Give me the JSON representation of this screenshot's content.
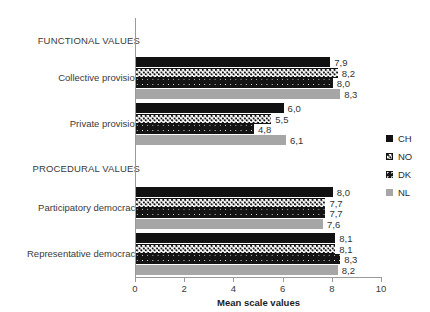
{
  "chart_data": {
    "type": "bar",
    "orientation": "horizontal",
    "title": "",
    "xlabel": "Mean scale values",
    "ylabel": "",
    "xlim": [
      0,
      10
    ],
    "xticks": [
      "0",
      "2",
      "4",
      "6",
      "8",
      "10"
    ],
    "grid": false,
    "legend_position": "right",
    "group_headers": [
      "FUNCTIONAL VALUES",
      "PROCEDURAL VALUES"
    ],
    "categories": [
      "Collective provision",
      "Private provision",
      "Participatory democracy",
      "Representative democracy"
    ],
    "series": [
      {
        "name": "CH",
        "pattern": "solid-black",
        "color": "#111111",
        "values": [
          7.9,
          6.0,
          8.0,
          8.1
        ],
        "labels": [
          "7,9",
          "6,0",
          "8,0",
          "8,1"
        ]
      },
      {
        "name": "NO",
        "pattern": "dotted-white",
        "color": "#ffffff",
        "values": [
          8.2,
          5.5,
          7.7,
          8.1
        ],
        "labels": [
          "8,2",
          "5,5",
          "7,7",
          "8,1"
        ]
      },
      {
        "name": "DK",
        "pattern": "dark-speckled",
        "color": "#141414",
        "values": [
          8.0,
          4.8,
          7.7,
          8.3
        ],
        "labels": [
          "8,0",
          "4,8",
          "7,7",
          "8,3"
        ]
      },
      {
        "name": "NL",
        "pattern": "solid-gray",
        "color": "#a6a6a6",
        "values": [
          8.3,
          6.1,
          7.6,
          8.2
        ],
        "labels": [
          "8,3",
          "6,1",
          "7,6",
          "8,2"
        ]
      }
    ]
  },
  "legend": {
    "items": [
      {
        "label": "CH"
      },
      {
        "label": "NO"
      },
      {
        "label": "DK"
      },
      {
        "label": "NL"
      }
    ]
  },
  "axis": {
    "x_title": "Mean scale values",
    "ticks": [
      "0",
      "2",
      "4",
      "6",
      "8",
      "10"
    ]
  },
  "labels": {
    "functional_header": "FUNCTIONAL VALUES",
    "procedural_header": "PROCEDURAL VALUES",
    "collective_provision": "Collective provision",
    "private_provision": "Private provision",
    "participatory_democracy": "Participatory democracy",
    "representative_democracy": "Representative democracy"
  }
}
